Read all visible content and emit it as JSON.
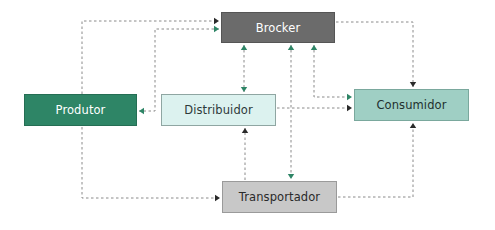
{
  "diagram": {
    "type": "flow",
    "colors": {
      "black_edge": "#2a2a2a",
      "green_edge": "#2e8566",
      "dash_gray": "#8a8a8a"
    },
    "nodes": [
      {
        "id": "brocker",
        "label": "Brocker",
        "x": 221,
        "y": 12,
        "w": 114,
        "h": 31,
        "fill": "#6b6b6b",
        "border": "#555555",
        "text": "#ffffff"
      },
      {
        "id": "produtor",
        "label": "Produtor",
        "x": 24,
        "y": 94,
        "w": 113,
        "h": 32,
        "fill": "#2e8566",
        "border": "#256e54",
        "text": "#ffffff"
      },
      {
        "id": "distribuidor",
        "label": "Distribuidor",
        "x": 161,
        "y": 94,
        "w": 115,
        "h": 32,
        "fill": "#dcf2ef",
        "border": "#8fa6a2",
        "text": "#2e3a3a"
      },
      {
        "id": "consumidor",
        "label": "Consumidor",
        "x": 354,
        "y": 89,
        "w": 115,
        "h": 32,
        "fill": "#9fcfc4",
        "border": "#7aa89d",
        "text": "#22302e"
      },
      {
        "id": "transportador",
        "label": "Transportador",
        "x": 222,
        "y": 181,
        "w": 115,
        "h": 32,
        "fill": "#c8c8c8",
        "border": "#9a9a9a",
        "text": "#2a2a2a"
      }
    ],
    "edges": [
      {
        "id": "produtor-to-brocker",
        "from": "Produtor",
        "to": "Brocker",
        "color": "black",
        "points": [
          [
            82,
            94
          ],
          [
            82,
            21
          ],
          [
            219,
            21
          ]
        ],
        "head_end": true,
        "head_start": false
      },
      {
        "id": "brocker-produtor-via-green",
        "from": "Brocker",
        "to": "Produtor",
        "color": "green",
        "points": [
          [
            219,
            29
          ],
          [
            155,
            29
          ],
          [
            155,
            111
          ],
          [
            139,
            111
          ]
        ],
        "head_end": true,
        "head_start": true
      },
      {
        "id": "brocker-distribuidor",
        "from": "Brocker",
        "to": "Distribuidor",
        "color": "green",
        "points": [
          [
            244,
            45
          ],
          [
            244,
            92
          ]
        ],
        "head_end": true,
        "head_start": true
      },
      {
        "id": "brocker-transportador",
        "from": "Brocker",
        "to": "Transportador",
        "color": "green",
        "points": [
          [
            291,
            45
          ],
          [
            291,
            179
          ]
        ],
        "head_end": true,
        "head_start": true
      },
      {
        "id": "brocker-consumidor-green",
        "from": "Brocker",
        "to": "Consumidor",
        "color": "green",
        "points": [
          [
            314,
            45
          ],
          [
            314,
            97
          ],
          [
            352,
            97
          ]
        ],
        "head_end": true,
        "head_start": true
      },
      {
        "id": "distribuidor-to-consumidor",
        "from": "Distribuidor",
        "to": "Consumidor",
        "color": "black",
        "points": [
          [
            277,
            108
          ],
          [
            352,
            108
          ]
        ],
        "head_end": true,
        "head_start": false
      },
      {
        "id": "brocker-to-consumidor",
        "from": "Brocker",
        "to": "Consumidor",
        "color": "black",
        "points": [
          [
            336,
            22
          ],
          [
            413,
            22
          ],
          [
            413,
            87
          ]
        ],
        "head_end": true,
        "head_start": false
      },
      {
        "id": "produtor-to-transportador",
        "from": "Produtor",
        "to": "Transportador",
        "color": "black",
        "points": [
          [
            82,
            127
          ],
          [
            82,
            198
          ],
          [
            220,
            198
          ]
        ],
        "head_end": true,
        "head_start": false
      },
      {
        "id": "transportador-to-distribuidor",
        "from": "Transportador",
        "to": "Distribuidor",
        "color": "black",
        "points": [
          [
            245,
            180
          ],
          [
            245,
            128
          ]
        ],
        "head_end": true,
        "head_start": false
      },
      {
        "id": "transportador-to-consumidor",
        "from": "Transportador",
        "to": "Consumidor",
        "color": "black",
        "points": [
          [
            338,
            197
          ],
          [
            413,
            197
          ],
          [
            413,
            123
          ]
        ],
        "head_end": true,
        "head_start": false
      }
    ]
  }
}
